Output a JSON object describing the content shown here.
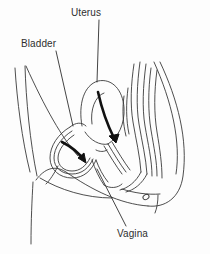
{
  "figure": {
    "type": "anatomical-line-drawing",
    "background_color": "#fdfdfd",
    "ink_color": "#3a3a3a",
    "arrow_color": "#111111",
    "label_color": "#2f2f2f"
  },
  "labels": [
    {
      "id": "uterus",
      "text": "Uterus",
      "x": 71,
      "y": 7,
      "leader": {
        "from_x": 99,
        "from_y": 20,
        "to_x": 97,
        "to_y": 82
      }
    },
    {
      "id": "bladder",
      "text": "Bladder",
      "x": 21,
      "y": 38,
      "leader": {
        "from_x": 56,
        "from_y": 51,
        "to_x": 73,
        "to_y": 126
      }
    },
    {
      "id": "vagina",
      "text": "Vagina",
      "x": 117,
      "y": 228,
      "leader": {
        "from_x": 126,
        "from_y": 226,
        "to_x": 97,
        "to_y": 169
      }
    }
  ],
  "arrows": [
    {
      "id": "bladder-arrow",
      "description": "curved bold arrow inside bladder pointing down-right"
    },
    {
      "id": "uterus-arrow",
      "description": "curved bold arrow from uterus body down to cervix"
    }
  ]
}
